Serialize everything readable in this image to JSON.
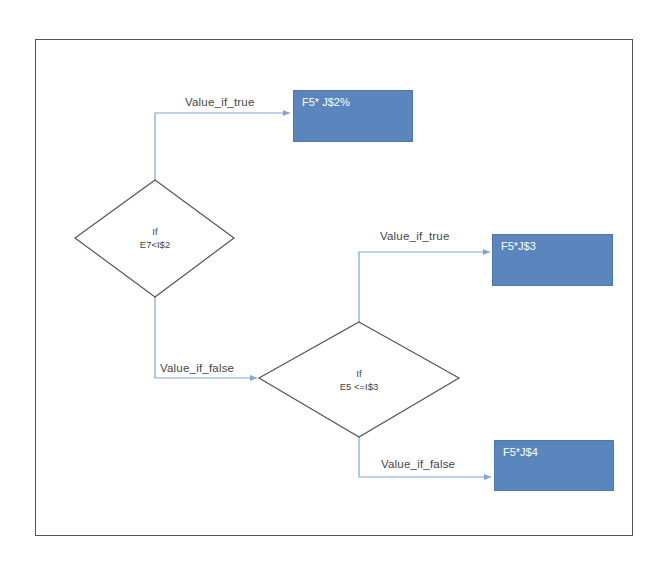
{
  "diagram": {
    "type": "flowchart",
    "colors": {
      "box_fill": "#5b86bd",
      "box_border": "#4f79ad",
      "box_text": "#ffffff",
      "connector": "#7fa6d6",
      "diamond_stroke": "#555555",
      "frame_stroke": "#555555",
      "label_text": "#444444"
    },
    "decisions": [
      {
        "id": "d1",
        "line1": "If",
        "line2": "E7<I$2"
      },
      {
        "id": "d2",
        "line1": "If",
        "line2": "E5 <=I$3"
      }
    ],
    "results": [
      {
        "id": "r1",
        "label": "F5* J$2%"
      },
      {
        "id": "r2",
        "label": "F5*J$3"
      },
      {
        "id": "r3",
        "label": "F5*J$4"
      }
    ],
    "edges": [
      {
        "from": "d1",
        "to": "r1",
        "label": "Value_if_true"
      },
      {
        "from": "d1",
        "to": "d2",
        "label": "Value_if_false"
      },
      {
        "from": "d2",
        "to": "r2",
        "label": "Value_if_true"
      },
      {
        "from": "d2",
        "to": "r3",
        "label": "Value_if_false"
      }
    ]
  }
}
